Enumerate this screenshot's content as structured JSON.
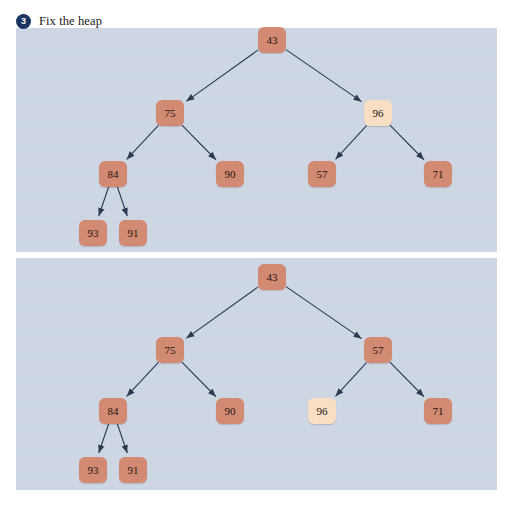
{
  "heading": {
    "step_number": "3",
    "text": "Fix the heap"
  },
  "colors": {
    "panel_background": "#ccd5e2",
    "node_normal": "#d38a72",
    "node_highlight": "#f8dfc4",
    "edge": "#2c3a52",
    "badge": "#1c3461",
    "page_background": "#ffffff",
    "node_text": "#231510"
  },
  "panels": [
    {
      "name": "before-swap",
      "nodes": [
        {
          "id": "t-43",
          "label": "43",
          "x": 272,
          "y": 40,
          "state": "normal"
        },
        {
          "id": "t-75",
          "label": "75",
          "x": 170,
          "y": 113,
          "state": "normal"
        },
        {
          "id": "t-96",
          "label": "96",
          "x": 378,
          "y": 113,
          "state": "highlight"
        },
        {
          "id": "t-84",
          "label": "84",
          "x": 113,
          "y": 174,
          "state": "normal"
        },
        {
          "id": "t-90",
          "label": "90",
          "x": 230,
          "y": 174,
          "state": "normal"
        },
        {
          "id": "t-57",
          "label": "57",
          "x": 322,
          "y": 174,
          "state": "normal"
        },
        {
          "id": "t-71",
          "label": "71",
          "x": 438,
          "y": 174,
          "state": "normal"
        },
        {
          "id": "t-93",
          "label": "93",
          "x": 93,
          "y": 233,
          "state": "normal"
        },
        {
          "id": "t-91",
          "label": "91",
          "x": 133,
          "y": 233,
          "state": "normal"
        }
      ],
      "edges": [
        {
          "from": "t-43",
          "to": "t-75"
        },
        {
          "from": "t-43",
          "to": "t-96"
        },
        {
          "from": "t-75",
          "to": "t-84"
        },
        {
          "from": "t-75",
          "to": "t-90"
        },
        {
          "from": "t-96",
          "to": "t-57"
        },
        {
          "from": "t-96",
          "to": "t-71"
        },
        {
          "from": "t-84",
          "to": "t-93"
        },
        {
          "from": "t-84",
          "to": "t-91"
        }
      ]
    },
    {
      "name": "after-swap",
      "nodes": [
        {
          "id": "b-43",
          "label": "43",
          "x": 272,
          "y": 277,
          "state": "normal"
        },
        {
          "id": "b-75",
          "label": "75",
          "x": 170,
          "y": 350,
          "state": "normal"
        },
        {
          "id": "b-57",
          "label": "57",
          "x": 378,
          "y": 350,
          "state": "normal"
        },
        {
          "id": "b-84",
          "label": "84",
          "x": 113,
          "y": 411,
          "state": "normal"
        },
        {
          "id": "b-90",
          "label": "90",
          "x": 230,
          "y": 411,
          "state": "normal"
        },
        {
          "id": "b-96",
          "label": "96",
          "x": 322,
          "y": 411,
          "state": "highlight"
        },
        {
          "id": "b-71",
          "label": "71",
          "x": 438,
          "y": 411,
          "state": "normal"
        },
        {
          "id": "b-93",
          "label": "93",
          "x": 93,
          "y": 470,
          "state": "normal"
        },
        {
          "id": "b-91",
          "label": "91",
          "x": 133,
          "y": 470,
          "state": "normal"
        }
      ],
      "edges": [
        {
          "from": "b-43",
          "to": "b-75"
        },
        {
          "from": "b-43",
          "to": "b-57"
        },
        {
          "from": "b-75",
          "to": "b-84"
        },
        {
          "from": "b-75",
          "to": "b-90"
        },
        {
          "from": "b-57",
          "to": "b-96"
        },
        {
          "from": "b-57",
          "to": "b-71"
        },
        {
          "from": "b-84",
          "to": "b-93"
        },
        {
          "from": "b-84",
          "to": "b-91"
        }
      ]
    }
  ]
}
